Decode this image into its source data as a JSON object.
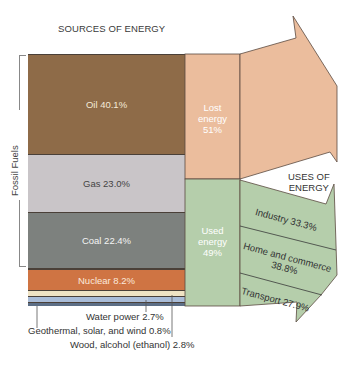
{
  "title": "SOURCES OF ENERGY",
  "fossil_fuels_label": "Fossil Fuels",
  "uses_title_line1": "USES OF",
  "uses_title_line2": "ENERGY",
  "sources": [
    {
      "name": "Oil",
      "label": "Oil 40.1%",
      "percent": 40.1,
      "color": "#8e6b48"
    },
    {
      "name": "Gas",
      "label": "Gas 23.0%",
      "percent": 23.0,
      "color": "#c9c5c8"
    },
    {
      "name": "Coal",
      "label": "Coal 22.4%",
      "percent": 22.4,
      "color": "#7d817e"
    },
    {
      "name": "Nuclear",
      "label": "Nuclear 8.2%",
      "percent": 8.2,
      "color": "#cf7443"
    },
    {
      "name": "Wood, alcohol (ethanol)",
      "label": "Wood, alcohol (ethanol) 2.8%",
      "percent": 2.8,
      "color": "#efe3c4"
    },
    {
      "name": "Water power",
      "label": "Water power 2.7%",
      "percent": 2.7,
      "color": "#a9bcd8"
    },
    {
      "name": "Geothermal, solar, and wind",
      "label": "Geothermal, solar, and wind 0.8%",
      "percent": 0.8,
      "color": "#5c6e86"
    }
  ],
  "lost": {
    "line1": "Lost",
    "line2": "energy",
    "line3": "51%",
    "percent": 51,
    "color": "#ebbd9d"
  },
  "used": {
    "line1": "Used",
    "line2": "energy",
    "line3": "49%",
    "percent": 49,
    "color": "#b5ceab"
  },
  "uses": [
    {
      "name": "Industry",
      "label": "Industry 33.3%",
      "percent": 33.3
    },
    {
      "name": "Home and commerce",
      "label_line1": "Home and commerce",
      "label_line2": "38.8%",
      "percent": 38.8
    },
    {
      "name": "Transport",
      "label": "Transport 27.9%",
      "percent": 27.9
    }
  ]
}
